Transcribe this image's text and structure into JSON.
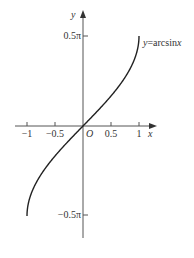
{
  "chart_data": {
    "type": "line",
    "title": "",
    "function_label": "y=arcsinx",
    "function_label_prefix": "y",
    "function_label_rest": "=arcsin",
    "function_label_var": "x",
    "xlabel": "x",
    "ylabel": "y",
    "origin_label": "O",
    "xlim": [
      -1.2,
      1.3
    ],
    "ylim": [
      -0.7854,
      0.7854
    ],
    "x_ticks": [
      -1,
      -0.5,
      0.5,
      1
    ],
    "x_tick_labels": [
      "−1",
      "−0.5",
      "0.5",
      "1"
    ],
    "y_ticks": [
      1.5708,
      -1.5708
    ],
    "y_tick_labels": [
      "0.5π",
      "−0.5π"
    ],
    "grid": false,
    "legend": "none",
    "series": [
      {
        "name": "y=arcsinx",
        "x": [
          -1,
          -0.95,
          -0.9,
          -0.8,
          -0.7,
          -0.6,
          -0.5,
          -0.4,
          -0.3,
          -0.2,
          -0.1,
          0,
          0.1,
          0.2,
          0.3,
          0.4,
          0.5,
          0.6,
          0.7,
          0.8,
          0.9,
          0.95,
          1
        ],
        "y": [
          -1.5708,
          -1.2532,
          -1.1198,
          -0.9273,
          -0.7754,
          -0.6435,
          -0.5236,
          -0.4115,
          -0.3047,
          -0.2014,
          -0.1002,
          0,
          0.1002,
          0.2014,
          0.3047,
          0.4115,
          0.5236,
          0.6435,
          0.7754,
          0.9273,
          1.1198,
          1.2532,
          1.5708
        ]
      }
    ]
  }
}
